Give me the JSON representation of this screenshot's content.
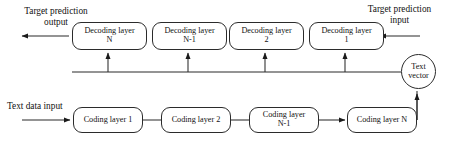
{
  "diagram": {
    "background_color": "#ffffff",
    "stroke_color": "#2b2b2b",
    "text_color": "#111111",
    "labels": {
      "target_prediction_output": "Target prediction\noutput",
      "target_prediction_input": "Target prediction\ninput",
      "text_data_input": "Text data input"
    },
    "decoder_row": {
      "name": "decoding-layer-row",
      "direction": "right-to-left",
      "nodes": [
        {
          "id": "decoding-layer-n",
          "line1": "Decoding layer",
          "line2": "N"
        },
        {
          "id": "decoding-layer-n-1",
          "line1": "Decoding layer",
          "line2": "N-1"
        },
        {
          "id": "decoding-layer-2",
          "line1": "Decoding layer",
          "line2": "2"
        },
        {
          "id": "decoding-layer-1",
          "line1": "Decoding layer",
          "line2": "1"
        }
      ]
    },
    "encoder_row": {
      "name": "coding-layer-row",
      "direction": "left-to-right",
      "nodes": [
        {
          "id": "coding-layer-1",
          "line1": "Coding layer 1",
          "line2": ""
        },
        {
          "id": "coding-layer-2",
          "line1": "Coding layer 2",
          "line2": ""
        },
        {
          "id": "coding-layer-n-1",
          "line1": "Coding layer",
          "line2": "N-1"
        },
        {
          "id": "coding-layer-n",
          "line1": "Coding layer N",
          "line2": ""
        }
      ]
    },
    "text_vector": {
      "id": "text-vector-node",
      "line1": "Text",
      "line2": "vector"
    },
    "connections": [
      {
        "from": "target-prediction-input",
        "to": "decoding-layer-1",
        "type": "arrow"
      },
      {
        "from": "decoding-layer-1",
        "to": "decoding-layer-2",
        "type": "arrow"
      },
      {
        "from": "decoding-layer-2",
        "to": "decoding-layer-n-1",
        "type": "arrow"
      },
      {
        "from": "decoding-layer-n-1",
        "to": "decoding-layer-n",
        "type": "arrow"
      },
      {
        "from": "decoding-layer-n",
        "to": "target-prediction-output",
        "type": "arrow"
      },
      {
        "from": "text-data-input",
        "to": "coding-layer-1",
        "type": "arrow"
      },
      {
        "from": "coding-layer-1",
        "to": "coding-layer-2",
        "type": "arrow"
      },
      {
        "from": "coding-layer-2",
        "to": "coding-layer-n-1",
        "type": "arrow"
      },
      {
        "from": "coding-layer-n-1",
        "to": "coding-layer-n",
        "type": "arrow"
      },
      {
        "from": "coding-layer-n",
        "to": "text-vector-node",
        "type": "arrow"
      },
      {
        "from": "text-vector-node",
        "to": "decoding-layer-1",
        "type": "bus-arrow"
      },
      {
        "from": "text-vector-node",
        "to": "decoding-layer-2",
        "type": "bus-arrow"
      },
      {
        "from": "text-vector-node",
        "to": "decoding-layer-n-1",
        "type": "bus-arrow"
      },
      {
        "from": "text-vector-node",
        "to": "decoding-layer-n",
        "type": "bus-arrow"
      }
    ]
  }
}
